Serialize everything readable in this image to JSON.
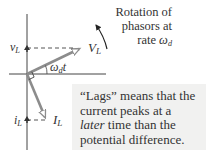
{
  "diagram": {
    "type": "phasor-diagram",
    "colors": {
      "axis": "#444444",
      "phasor": "#8c8c8c",
      "dashed": "#555555",
      "text": "#333333",
      "note_background": "#f1f1f0"
    },
    "labels": {
      "v_instant": {
        "main": "v",
        "sub": "L"
      },
      "V_amplitude": {
        "main": "V",
        "sub": "L"
      },
      "i_instant": {
        "main": "i",
        "sub": "L"
      },
      "I_amplitude": {
        "main": "I",
        "sub": "L"
      },
      "angle": {
        "main": "ω",
        "sub": "d",
        "suffix": "t"
      }
    },
    "rotation_annotation": {
      "line1": "Rotation of",
      "line2": "phasors at",
      "line3_prefix": "rate ",
      "line3_symbol": "ω",
      "line3_sub": "d"
    },
    "note": {
      "line1": "“Lags” means that the",
      "line2": "current peaks at a",
      "line3_emph": "later",
      "line3_rest": " time than the",
      "line4": "potential difference."
    }
  }
}
